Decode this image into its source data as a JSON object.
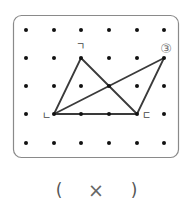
{
  "problem": {
    "number_label": "③",
    "grid": {
      "columns_x": [
        26,
        54,
        81,
        109,
        137,
        164
      ],
      "rows_y": [
        30,
        58,
        86,
        114,
        143
      ]
    },
    "vertices": {
      "giyeok": {
        "label": "ㄱ",
        "x": 81,
        "y": 58
      },
      "nieun": {
        "label": "ㄴ",
        "x": 54,
        "y": 114
      },
      "digeut": {
        "label": "ㄷ",
        "x": 137,
        "y": 114
      },
      "extra": {
        "x": 164,
        "y": 58
      }
    },
    "segments": [
      [
        "giyeok",
        "nieun"
      ],
      [
        "giyeok",
        "digeut"
      ],
      [
        "nieun",
        "digeut"
      ],
      [
        "nieun",
        "extra"
      ],
      [
        "extra",
        "digeut"
      ]
    ]
  },
  "answer": {
    "open_paren": "(",
    "mark": "×",
    "close_paren": ")"
  },
  "colors": {
    "line": "#3a3a3a",
    "dot": "#111111",
    "border": "#8a8a8a",
    "label": "#444444",
    "number": "#777777"
  }
}
